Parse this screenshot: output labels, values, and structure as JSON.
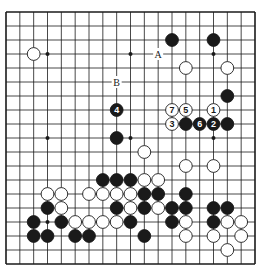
{
  "diagram": {
    "type": "go-board",
    "size": 19,
    "colors": {
      "background": "#ffffff",
      "line": "#1a1a1a",
      "black_stone": "#1a1a1a",
      "white_stone": "#ffffff",
      "stone_outline": "#1a1a1a"
    },
    "star_points": [
      [
        3,
        3
      ],
      [
        9,
        3
      ],
      [
        15,
        3
      ],
      [
        3,
        9
      ],
      [
        9,
        9
      ],
      [
        15,
        9
      ],
      [
        3,
        15
      ]
    ],
    "black_stones": [
      {
        "col": 12,
        "row": 2
      },
      {
        "col": 15,
        "row": 2
      },
      {
        "col": 16,
        "row": 6
      },
      {
        "col": 8,
        "row": 7,
        "label": "4"
      },
      {
        "col": 13,
        "row": 8
      },
      {
        "col": 14,
        "row": 8,
        "label": "6"
      },
      {
        "col": 15,
        "row": 8,
        "label": "2"
      },
      {
        "col": 16,
        "row": 8
      },
      {
        "col": 8,
        "row": 9
      },
      {
        "col": 7,
        "row": 12
      },
      {
        "col": 8,
        "row": 12
      },
      {
        "col": 9,
        "row": 12
      },
      {
        "col": 10,
        "row": 13
      },
      {
        "col": 11,
        "row": 13
      },
      {
        "col": 13,
        "row": 13
      },
      {
        "col": 3,
        "row": 14
      },
      {
        "col": 8,
        "row": 14
      },
      {
        "col": 10,
        "row": 14
      },
      {
        "col": 12,
        "row": 14
      },
      {
        "col": 13,
        "row": 14
      },
      {
        "col": 15,
        "row": 14
      },
      {
        "col": 16,
        "row": 14
      },
      {
        "col": 2,
        "row": 15
      },
      {
        "col": 4,
        "row": 15
      },
      {
        "col": 9,
        "row": 15
      },
      {
        "col": 12,
        "row": 15
      },
      {
        "col": 15,
        "row": 15
      },
      {
        "col": 2,
        "row": 16
      },
      {
        "col": 3,
        "row": 16
      },
      {
        "col": 5,
        "row": 16
      },
      {
        "col": 6,
        "row": 16
      },
      {
        "col": 10,
        "row": 16
      }
    ],
    "white_stones": [
      {
        "col": 2,
        "row": 3
      },
      {
        "col": 13,
        "row": 4
      },
      {
        "col": 16,
        "row": 4
      },
      {
        "col": 12,
        "row": 7,
        "label": "7"
      },
      {
        "col": 13,
        "row": 7,
        "label": "5"
      },
      {
        "col": 15,
        "row": 7,
        "label": "1"
      },
      {
        "col": 12,
        "row": 8,
        "label": "3"
      },
      {
        "col": 10,
        "row": 10
      },
      {
        "col": 13,
        "row": 11
      },
      {
        "col": 15,
        "row": 11
      },
      {
        "col": 10,
        "row": 12
      },
      {
        "col": 11,
        "row": 12
      },
      {
        "col": 3,
        "row": 13
      },
      {
        "col": 4,
        "row": 13
      },
      {
        "col": 6,
        "row": 13
      },
      {
        "col": 7,
        "row": 13
      },
      {
        "col": 8,
        "row": 13
      },
      {
        "col": 9,
        "row": 13
      },
      {
        "col": 4,
        "row": 14
      },
      {
        "col": 9,
        "row": 14
      },
      {
        "col": 11,
        "row": 14
      },
      {
        "col": 5,
        "row": 15
      },
      {
        "col": 6,
        "row": 15
      },
      {
        "col": 7,
        "row": 15
      },
      {
        "col": 8,
        "row": 15
      },
      {
        "col": 13,
        "row": 15
      },
      {
        "col": 16,
        "row": 15
      },
      {
        "col": 17,
        "row": 15
      },
      {
        "col": 13,
        "row": 16
      },
      {
        "col": 15,
        "row": 16
      },
      {
        "col": 17,
        "row": 16
      },
      {
        "col": 16,
        "row": 17
      }
    ],
    "point_labels": [
      {
        "col": 11,
        "row": 3,
        "text": "A"
      },
      {
        "col": 8,
        "row": 5,
        "text": "B"
      }
    ]
  }
}
